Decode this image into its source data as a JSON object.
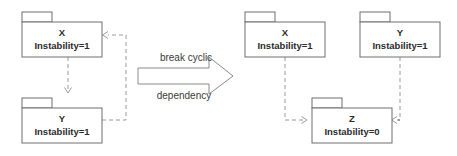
{
  "diagram": {
    "background_color": "#ffffff",
    "box_stroke_color": "#6e6e6e",
    "dependency_color": "#9a9a9a",
    "text_color": "#2b2b2b",
    "left_side": {
      "packages": [
        {
          "id": "left-x",
          "name": "X",
          "metric": "Instability=1",
          "x": 22,
          "y": 12,
          "width": 80,
          "height": 45
        },
        {
          "id": "left-y",
          "name": "Y",
          "metric": "Instability=1",
          "x": 22,
          "y": 98,
          "width": 80,
          "height": 45
        }
      ],
      "dependencies": [
        {
          "from": "X",
          "to": "Y",
          "style": "dashed",
          "direction": "down"
        },
        {
          "from": "Y",
          "to": "X",
          "style": "dashed",
          "direction": "up-left"
        }
      ]
    },
    "transform_arrow": {
      "line_1": "break cyclic",
      "line_2": "dependency",
      "direction": "right"
    },
    "right_side": {
      "packages": [
        {
          "id": "right-x",
          "name": "X",
          "metric": "Instability=1",
          "x": 245,
          "y": 12,
          "width": 80,
          "height": 45
        },
        {
          "id": "right-y",
          "name": "Y",
          "metric": "Instability=1",
          "x": 360,
          "y": 12,
          "width": 80,
          "height": 45
        },
        {
          "id": "right-z",
          "name": "Z",
          "metric": "Instability=0",
          "x": 312,
          "y": 98,
          "width": 80,
          "height": 45
        }
      ],
      "dependencies": [
        {
          "from": "X",
          "to": "Z",
          "style": "dashed",
          "direction": "down-right"
        },
        {
          "from": "Y",
          "to": "Z",
          "style": "dashed",
          "direction": "down-left"
        }
      ]
    }
  }
}
